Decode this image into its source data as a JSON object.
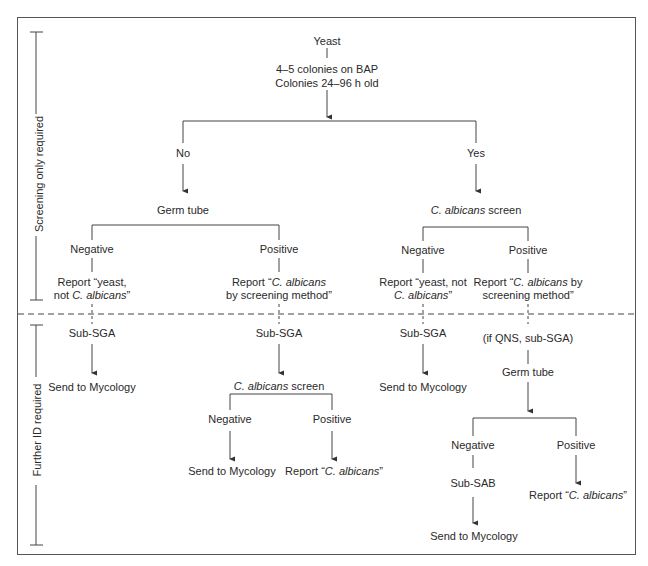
{
  "diagram": {
    "type": "flowchart",
    "sections": {
      "screening": "Screening only required",
      "further": "Further ID required"
    },
    "nodes": {
      "root": "Yeast",
      "criteria_1": "4–5 colonies on BAP",
      "criteria_2": "Colonies 24–96 h old",
      "no": "No",
      "yes": "Yes",
      "germ_tube": "Germ tube",
      "ca_screen_label": "C. albicans",
      "ca_screen_rest": " screen",
      "gt_negative": "Negative",
      "gt_positive": "Positive",
      "ca_negative": "Negative",
      "ca_positive": "Positive",
      "gt_neg_report_1": "Report “yeast,",
      "gt_neg_report_2a": "not ",
      "gt_neg_report_2b": "C. albicans",
      "gt_neg_report_2c": "”",
      "gt_pos_report_1a": "Report “",
      "gt_pos_report_1b": "C. albicans",
      "gt_pos_report_2": "by screening method”",
      "ca_neg_report_1": "Report “yeast, not",
      "ca_neg_report_2a": "C. albicans",
      "ca_neg_report_2b": "”",
      "ca_pos_report_1a": "Report “",
      "ca_pos_report_1b": "C. albicans",
      "ca_pos_report_1c": " by",
      "ca_pos_report_2": "screening method”",
      "sub_sga_1": "Sub-SGA",
      "sub_sga_2": "Sub-SGA",
      "sub_sga_3": "Sub-SGA",
      "if_qns": "(if QNS, sub-SGA)",
      "send_1": "Send to Mycology",
      "send_3": "Send to Mycology",
      "mid_ca_screen_a": "C. albicans",
      "mid_ca_screen_b": " screen",
      "mid_negative": "Negative",
      "mid_positive": "Positive",
      "mid_send": "Send to Mycology",
      "mid_report_a": "Report “",
      "mid_report_b": "C. albicans",
      "mid_report_c": "”",
      "right_germ_tube": "Germ tube",
      "right_negative": "Negative",
      "right_positive": "Positive",
      "sub_sab": "Sub-SAB",
      "right_send": "Send to Mycology",
      "right_report_a": "Report “",
      "right_report_b": "C. albicans",
      "right_report_c": "”"
    }
  }
}
